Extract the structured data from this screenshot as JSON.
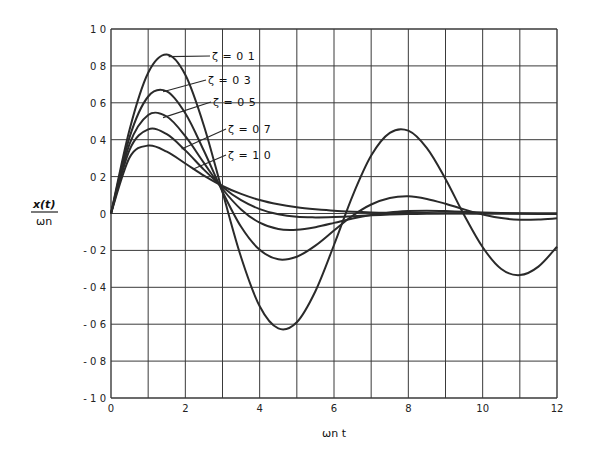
{
  "chart_data": {
    "type": "line",
    "title": "",
    "xlabel": "ωn t",
    "ylabel": "x(t) / ωn",
    "xlim": [
      0,
      12
    ],
    "ylim": [
      -1.0,
      1.0
    ],
    "grid": true,
    "legend_position": "inline labels with leader lines (upper left)",
    "x_ticks": [
      0,
      2,
      4,
      6,
      8,
      10,
      12
    ],
    "x_tick_labels": [
      "0",
      "2",
      "4",
      "6",
      "8",
      "10",
      "12"
    ],
    "y_ticks": [
      1.0,
      0.8,
      0.6,
      0.4,
      0.2,
      0,
      -0.2,
      -0.4,
      -0.6,
      -0.8,
      -1.0
    ],
    "y_tick_labels": [
      "1 0",
      "0 8",
      "0 6",
      "0 4",
      "0 2",
      "0",
      "- 0 2",
      "- 0 4",
      "- 0 6",
      "- 0 8",
      "- 1 0"
    ],
    "x": [
      0,
      0.5,
      1,
      1.5,
      2,
      2.5,
      3,
      3.5,
      4,
      4.5,
      5,
      5.5,
      6,
      6.5,
      7,
      7.5,
      8,
      8.5,
      9,
      9.5,
      10,
      10.5,
      11,
      11.5,
      12
    ],
    "series": [
      {
        "name": "ζ = 0.1",
        "label": "ζ = 0 1",
        "label_pos": [
          212,
          60
        ],
        "leader_to": [
          1.55,
          0.85
        ],
        "values": [
          0,
          0.456,
          0.763,
          0.862,
          0.752,
          0.476,
          0.116,
          -0.237,
          -0.503,
          -0.623,
          -0.589,
          -0.421,
          -0.171,
          0.096,
          0.314,
          0.437,
          0.449,
          0.354,
          0.187,
          -0.008,
          -0.183,
          -0.301,
          -0.334,
          -0.288,
          -0.18
        ]
      },
      {
        "name": "ζ = 0.3",
        "label": "ζ = 0 3",
        "label_pos": [
          208,
          84
        ],
        "leader_to": [
          1.4,
          0.66
        ],
        "values": [
          0,
          0.414,
          0.634,
          0.662,
          0.543,
          0.34,
          0.118,
          -0.072,
          -0.197,
          -0.248,
          -0.234,
          -0.174,
          -0.092,
          -0.012,
          0.049,
          0.084,
          0.093,
          0.079,
          0.053,
          0.022,
          -0.006,
          -0.025,
          -0.034,
          -0.033,
          -0.026
        ]
      },
      {
        "name": "ζ = 0.5",
        "label": "ζ = 0 5",
        "label_pos": [
          213,
          106
        ],
        "leader_to": [
          1.4,
          0.52
        ],
        "values": [
          0,
          0.377,
          0.534,
          0.526,
          0.419,
          0.274,
          0.133,
          0.022,
          -0.05,
          -0.084,
          -0.088,
          -0.074,
          -0.051,
          -0.027,
          -0.008,
          0.006,
          0.013,
          0.015,
          0.013,
          0.009,
          0.006,
          0.002,
          0.0,
          -0.002,
          -0.002
        ]
      },
      {
        "name": "ζ = 0.7",
        "label": "ζ = 0 7",
        "label_pos": [
          228,
          133
        ],
        "leader_to": [
          1.9,
          0.35
        ],
        "values": [
          0,
          0.345,
          0.456,
          0.43,
          0.342,
          0.238,
          0.144,
          0.072,
          0.024,
          -0.004,
          -0.018,
          -0.021,
          -0.019,
          -0.015,
          -0.01,
          -0.006,
          -0.003,
          -0.001,
          0.0,
          0.0,
          0.0,
          0.0,
          0.0,
          0.0,
          0.0
        ]
      },
      {
        "name": "ζ = 1.0",
        "label": "ζ = 1 0",
        "label_pos": [
          228,
          159
        ],
        "leader_to": [
          2.2,
          0.24
        ],
        "values": [
          0,
          0.303,
          0.368,
          0.335,
          0.271,
          0.205,
          0.149,
          0.106,
          0.073,
          0.05,
          0.034,
          0.023,
          0.015,
          0.01,
          0.006,
          0.004,
          0.003,
          0.002,
          0.001,
          0.001,
          0.0,
          0.0,
          0.0,
          0.0,
          0.0
        ]
      }
    ]
  },
  "colors": {
    "curve": "#2a2a2a",
    "grid": "#3a3a3a",
    "text": "#1a1a1a",
    "background": "#ffffff"
  },
  "axes": {
    "ylabel_top": "x(t)",
    "ylabel_bottom": "ωn",
    "xlabel": "ωn t"
  }
}
